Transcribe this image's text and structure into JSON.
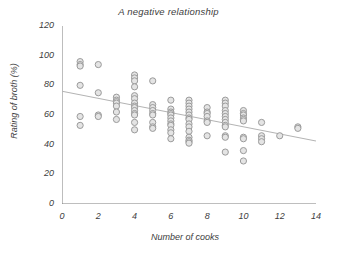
{
  "chart_data": {
    "type": "scatter",
    "title": "A negative relationship",
    "xlabel": "Number of cooks",
    "ylabel": "Rating of broth (%)",
    "xlim": [
      0,
      14
    ],
    "ylim": [
      0,
      120
    ],
    "xticks": [
      0,
      2,
      4,
      6,
      8,
      10,
      12,
      14
    ],
    "xtick_labels": [
      "0",
      "2",
      "4",
      "6",
      "8",
      "10",
      "12",
      "14"
    ],
    "xminor_ticks": [
      1,
      3,
      5,
      7,
      9,
      11,
      13
    ],
    "yticks": [
      0,
      20,
      40,
      60,
      80,
      100,
      120
    ],
    "ytick_labels": [
      "0",
      "20",
      "40",
      "60",
      "80",
      "100",
      "120"
    ],
    "grid": false,
    "legend": null,
    "marker": {
      "shape": "open-circle",
      "radius_px": 3.1,
      "stroke": "#9b9b9b",
      "fill": "#e4e4e4",
      "stroke_width": 1
    },
    "trendline": {
      "label": "linear fit",
      "color": "#b4b4b4",
      "width": 1.1,
      "x_start": 0,
      "y_start": 76,
      "x_end": 14,
      "y_end": 42.5
    },
    "x": [
      1,
      1,
      1,
      1,
      1,
      1,
      2,
      2,
      2,
      2,
      3,
      3,
      3,
      3,
      3,
      3,
      3,
      4,
      4,
      4,
      4,
      4,
      4,
      4,
      4,
      4,
      4,
      4,
      4,
      4,
      4,
      5,
      5,
      5,
      5,
      5,
      5,
      5,
      5,
      5,
      6,
      6,
      6,
      6,
      6,
      6,
      6,
      6,
      6,
      6,
      6,
      6,
      7,
      7,
      7,
      7,
      7,
      7,
      7,
      7,
      7,
      7,
      7,
      7,
      7,
      7,
      7,
      8,
      8,
      8,
      8,
      8,
      8,
      8,
      9,
      9,
      9,
      9,
      9,
      9,
      9,
      9,
      9,
      9,
      9,
      9,
      9,
      10,
      10,
      10,
      10,
      10,
      10,
      10,
      10,
      10,
      10,
      11,
      11,
      11,
      11,
      12,
      13,
      13
    ],
    "y": [
      96,
      94,
      93,
      80,
      59,
      53,
      94,
      75,
      60,
      59,
      72,
      70,
      69,
      68,
      66,
      62,
      57,
      87,
      85,
      83,
      79,
      73,
      71,
      68,
      66,
      65,
      63,
      61,
      60,
      55,
      50,
      83,
      67,
      65,
      63,
      61,
      60,
      55,
      52,
      51,
      70,
      64,
      62,
      61,
      60,
      58,
      56,
      54,
      53,
      50,
      48,
      44,
      70,
      68,
      66,
      64,
      62,
      60,
      58,
      57,
      54,
      52,
      49,
      45,
      43,
      42,
      41,
      65,
      62,
      61,
      59,
      56,
      55,
      46,
      70,
      68,
      66,
      63,
      61,
      59,
      57,
      55,
      53,
      52,
      46,
      45,
      35,
      63,
      61,
      60,
      58,
      57,
      56,
      45,
      44,
      36,
      29,
      55,
      46,
      44,
      42,
      46,
      52,
      51
    ],
    "series_name": "broth ratings",
    "n_points": 101
  }
}
